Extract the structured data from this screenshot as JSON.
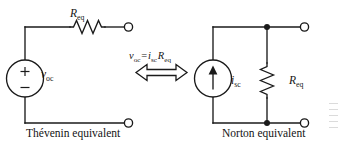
{
  "figure": {
    "background_color": "#ffffff",
    "line_color": "#1a1a1a",
    "text_color": "#141414"
  },
  "thevenin": {
    "caption": "Thévenin equivalent",
    "resistor_label": "R",
    "resistor_subscript": "eq",
    "source_label": "v",
    "source_subscript": "oc",
    "source_plus": "+",
    "source_minus": "−",
    "source_type": "voltage-source",
    "resistor_orientation": "horizontal",
    "terminals": 2
  },
  "relation": {
    "equation_lhs": "v",
    "equation_lhs_sub": "oc",
    "equation_op": "=",
    "equation_rhs_i": "i",
    "equation_rhs_i_sub": "sc",
    "equation_rhs_r": "R",
    "equation_rhs_r_sub": "eq",
    "equation_plain": "v_oc = i_sc R_eq",
    "arrow": "double-headed-horizontal-arrow"
  },
  "norton": {
    "caption": "Norton equivalent",
    "source_label": "i",
    "source_subscript": "sc",
    "source_type": "current-source",
    "source_arrow_direction": "up",
    "resistor_label": "R",
    "resistor_subscript": "eq",
    "resistor_orientation": "vertical",
    "junction_dots": 2,
    "terminals": 2
  }
}
